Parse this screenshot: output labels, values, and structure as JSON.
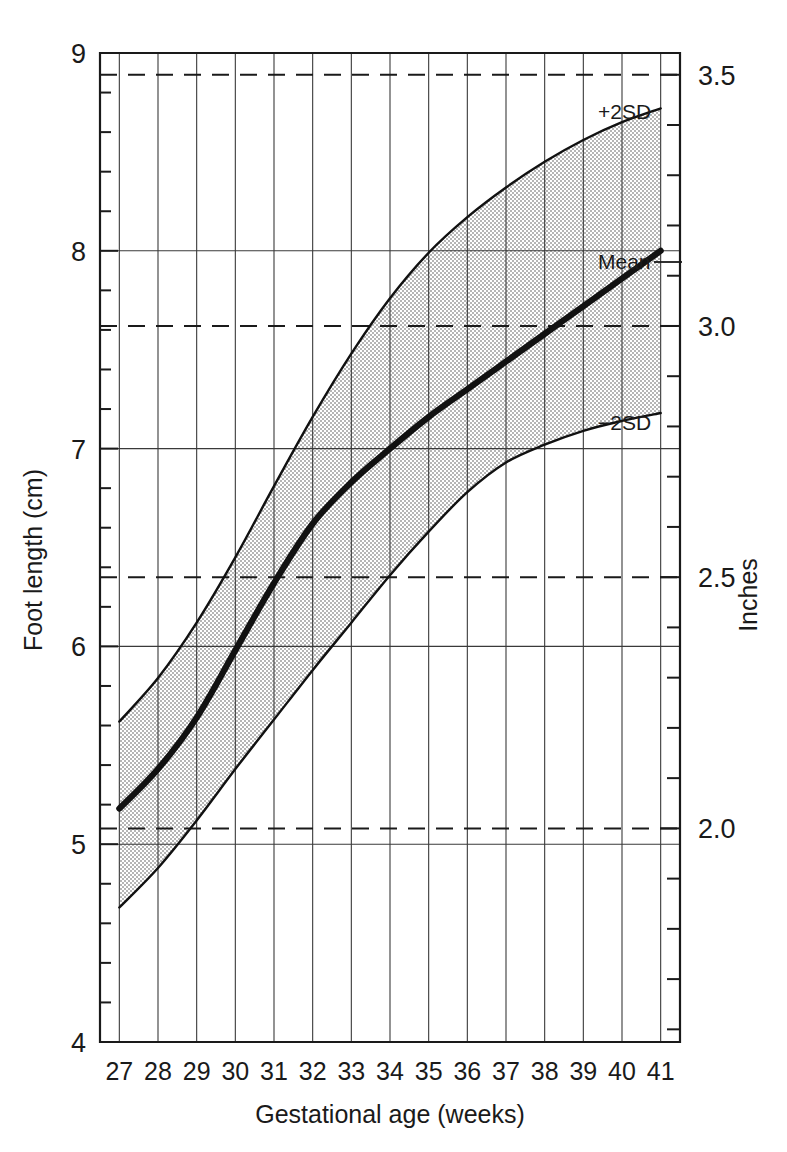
{
  "chart_data": {
    "type": "line",
    "title": "",
    "xlabel": "Gestational age (weeks)",
    "ylabel": "Foot length (cm)",
    "y2label": "Inches",
    "xlim": [
      26.5,
      41.5
    ],
    "ylim": [
      4,
      9
    ],
    "y2lim": [
      1.5748,
      3.5433
    ],
    "grid": true,
    "legend_position": "inline-right",
    "x": [
      27,
      28,
      29,
      30,
      31,
      32,
      33,
      34,
      35,
      36,
      37,
      38,
      39,
      40,
      41
    ],
    "xtick_labels": [
      "27",
      "28",
      "29",
      "30",
      "31",
      "32",
      "33",
      "34",
      "35",
      "36",
      "37",
      "38",
      "39",
      "40",
      "41"
    ],
    "ytick_labels": [
      "9",
      "8",
      "7",
      "6",
      "5",
      "4"
    ],
    "ytick_values": [
      9,
      8,
      7,
      6,
      5,
      4
    ],
    "ytick_minor_step": 0.2,
    "y2tick_labels": [
      "3.5",
      "3.0",
      "2.5",
      "2.0"
    ],
    "y2tick_values": [
      3.5,
      3.0,
      2.5,
      2.0
    ],
    "y2tick_minor_step": 0.1,
    "series": [
      {
        "name": "+2SD",
        "label": "+2SD",
        "values": [
          5.62,
          5.84,
          6.12,
          6.45,
          6.81,
          7.16,
          7.48,
          7.76,
          7.99,
          8.17,
          8.32,
          8.45,
          8.56,
          8.65,
          8.72
        ]
      },
      {
        "name": "Mean",
        "label": "Mean",
        "values": [
          5.18,
          5.38,
          5.64,
          5.98,
          6.32,
          6.62,
          6.83,
          7.0,
          7.16,
          7.3,
          7.44,
          7.58,
          7.72,
          7.86,
          8.0
        ]
      },
      {
        "name": "-2SD",
        "label": "−2SD",
        "values": [
          4.68,
          4.88,
          5.12,
          5.38,
          5.63,
          5.88,
          6.12,
          6.36,
          6.58,
          6.78,
          6.93,
          7.02,
          7.09,
          7.14,
          7.18
        ]
      }
    ],
    "band": {
      "name": "±2SD range",
      "fill_pattern": "stipple",
      "fill_color": "#c9c9c9",
      "upper_series": "+2SD",
      "lower_series": "-2SD"
    },
    "dashed_gridlines_cm": [
      8.89,
      7.62,
      6.35,
      5.08
    ],
    "solid_gridlines_cm": [
      9,
      8,
      7,
      6,
      5,
      4
    ],
    "colors": {
      "axis": "#1a1a1a",
      "curve": "#111111",
      "grid": "#3a3a3a",
      "band_fill": "#c9c9c9",
      "background": "#ffffff"
    }
  }
}
